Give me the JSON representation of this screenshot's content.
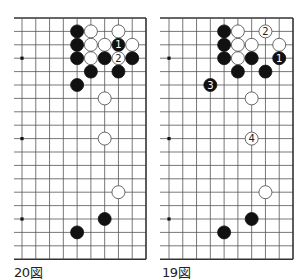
{
  "grid": {
    "spacing": 13.8,
    "row_spacing": 13.4,
    "top_y": 18,
    "rows": 19,
    "line_color": "#555555",
    "edge_color": "#333333"
  },
  "diagrams": [
    {
      "id": "fig20",
      "caption": "20図",
      "caption_x": 14,
      "left_partial_x": 14,
      "first_col_x": 22,
      "right_edge_x": 146,
      "star_points": [
        [
          0,
          3
        ],
        [
          0,
          9
        ],
        [
          0,
          15
        ]
      ],
      "stones": [
        {
          "color": "black",
          "col": 4,
          "row": 1
        },
        {
          "color": "white",
          "col": 5,
          "row": 1
        },
        {
          "color": "white",
          "col": 7,
          "row": 1
        },
        {
          "color": "black",
          "col": 4,
          "row": 2
        },
        {
          "color": "white",
          "col": 5,
          "row": 2
        },
        {
          "color": "white",
          "col": 6,
          "row": 2
        },
        {
          "color": "black",
          "col": 7,
          "row": 2,
          "label": "1"
        },
        {
          "color": "white",
          "col": 8,
          "row": 2
        },
        {
          "color": "black",
          "col": 4,
          "row": 3
        },
        {
          "color": "white",
          "col": 5,
          "row": 3
        },
        {
          "color": "black",
          "col": 6,
          "row": 3
        },
        {
          "color": "white",
          "col": 7,
          "row": 3,
          "label": "2"
        },
        {
          "color": "black",
          "col": 8,
          "row": 3
        },
        {
          "color": "black",
          "col": 5,
          "row": 4
        },
        {
          "color": "black",
          "col": 7,
          "row": 4
        },
        {
          "color": "black",
          "col": 4,
          "row": 5
        },
        {
          "color": "white",
          "col": 6,
          "row": 6
        },
        {
          "color": "white",
          "col": 6,
          "row": 9
        },
        {
          "color": "white",
          "col": 7,
          "row": 13
        },
        {
          "color": "black",
          "col": 6,
          "row": 15
        },
        {
          "color": "black",
          "col": 4,
          "row": 16
        }
      ]
    },
    {
      "id": "fig19",
      "caption": "19図",
      "caption_x": 162,
      "left_partial_x": 160,
      "first_col_x": 169,
      "right_edge_x": 293,
      "star_points": [
        [
          0,
          3
        ],
        [
          0,
          9
        ],
        [
          0,
          15
        ]
      ],
      "stones": [
        {
          "color": "black",
          "col": 4,
          "row": 1
        },
        {
          "color": "white",
          "col": 5,
          "row": 1
        },
        {
          "color": "white",
          "col": 7,
          "row": 1,
          "label": "2"
        },
        {
          "color": "black",
          "col": 4,
          "row": 2
        },
        {
          "color": "white",
          "col": 5,
          "row": 2
        },
        {
          "color": "white",
          "col": 6,
          "row": 2
        },
        {
          "color": "white",
          "col": 8,
          "row": 2
        },
        {
          "color": "black",
          "col": 4,
          "row": 3
        },
        {
          "color": "white",
          "col": 5,
          "row": 3
        },
        {
          "color": "black",
          "col": 6,
          "row": 3
        },
        {
          "color": "black",
          "col": 8,
          "row": 3,
          "label": "1"
        },
        {
          "color": "black",
          "col": 5,
          "row": 4
        },
        {
          "color": "black",
          "col": 7,
          "row": 4
        },
        {
          "color": "black",
          "col": 3,
          "row": 5,
          "label": "3"
        },
        {
          "color": "white",
          "col": 6,
          "row": 6
        },
        {
          "color": "white",
          "col": 6,
          "row": 9,
          "label": "4"
        },
        {
          "color": "white",
          "col": 7,
          "row": 13
        },
        {
          "color": "black",
          "col": 6,
          "row": 15
        },
        {
          "color": "black",
          "col": 4,
          "row": 16
        }
      ]
    }
  ]
}
